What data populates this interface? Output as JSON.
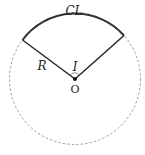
{
  "diagram": {
    "labels": {
      "arc": "CL",
      "radius": "R",
      "angle": "I",
      "center": "O"
    },
    "colors": {
      "stroke": "#333333",
      "dashed": "#888888"
    }
  }
}
